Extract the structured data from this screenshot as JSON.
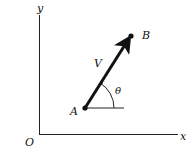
{
  "diagram": {
    "type": "vector-in-plane",
    "axes": {
      "x_label": "x",
      "y_label": "y",
      "origin_label": "O"
    },
    "points": [
      {
        "label": "A",
        "role": "tail"
      },
      {
        "label": "B",
        "role": "head"
      }
    ],
    "vector": {
      "label": "V",
      "from": "A",
      "to": "B"
    },
    "angle": {
      "label": "θ",
      "measured_from": "horizontal at A"
    },
    "colors": {
      "ink": "#111111",
      "background": "#ffffff"
    }
  }
}
